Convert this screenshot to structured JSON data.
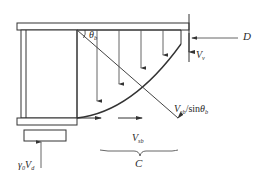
{
  "figure": {
    "type": "engineering-diagram",
    "stroke_color": "#333333",
    "fill_color": "#ffffff",
    "background": "#ffffff"
  },
  "labels": {
    "applied_load_D": "D",
    "shear_vertical": "V",
    "shear_vertical_sub": "v",
    "inclined_shear": "V",
    "inclined_shear_sub": "sb",
    "inclined_shear_denom": "/sin",
    "inclined_shear_angle": "θ",
    "inclined_shear_angle_sub": "b",
    "angle_theta": "θ",
    "angle_theta_sub": "b",
    "horizontal_shear": "V",
    "horizontal_shear_sub": "sb",
    "compression_C": "C",
    "reaction_gamma": "γ",
    "reaction_gamma_sub": "0",
    "reaction_V": "V",
    "reaction_V_sub": "d"
  },
  "geometry": {
    "top_flange": {
      "x": 17,
      "y": 23,
      "w": 172,
      "h": 7
    },
    "web_box": {
      "x": 21,
      "y": 30,
      "w": 56,
      "h": 88
    },
    "web_inner_left": 26,
    "bottom_flange": {
      "x": 17,
      "y": 118,
      "w": 60,
      "h": 7
    },
    "base_plate": {
      "x": 24,
      "y": 130,
      "w": 42,
      "h": 11
    },
    "taper_start_x": 77,
    "taper_end_x": 181,
    "taper_top_y": 30,
    "taper_bottom_y": 118,
    "right_edge_x": 189,
    "vertical_datum_x": 189,
    "vertical_datum_top": 14,
    "vertical_datum_bottom": 62
  },
  "vertical_arrows": [
    {
      "x": 97,
      "y_top": 30,
      "y_bottom": 101
    },
    {
      "x": 119,
      "y_top": 30,
      "y_bottom": 84
    },
    {
      "x": 141,
      "y_top": 30,
      "y_bottom": 68
    },
    {
      "x": 163,
      "y_top": 30,
      "y_bottom": 55
    },
    {
      "x": 183,
      "y_top": 34,
      "y_bottom": 50
    }
  ],
  "horizontal_arrows": [
    {
      "x_start": 77,
      "x_end": 100,
      "y": 118
    },
    {
      "x_start": 118,
      "x_end": 141,
      "y": 118
    }
  ],
  "diagonals": {
    "from_top_to_bottom_right": {
      "x1": 77,
      "y1": 30,
      "x2": 178,
      "y2": 118
    },
    "curve_haunch": {
      "x1": 77,
      "y1": 118,
      "x2": 181,
      "y2": 44
    }
  },
  "brace": {
    "x_left": 100,
    "x_right": 178,
    "y": 150,
    "tip_x": 140,
    "tip_y": 156
  },
  "d_arrow": {
    "x_start": 238,
    "x_end": 191,
    "y": 38
  },
  "reaction_arrow": {
    "x": 41,
    "y_top": 141,
    "y_bottom": 168
  }
}
